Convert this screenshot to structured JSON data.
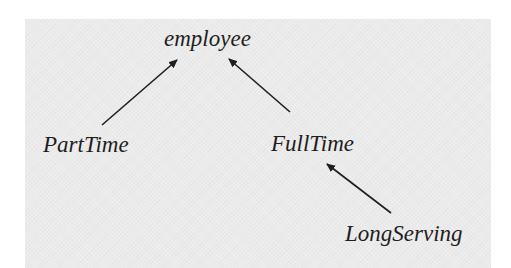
{
  "diagram": {
    "type": "inheritance-hierarchy",
    "background_color": "#ebebeb",
    "line_color": "#1e1e1e",
    "nodes": [
      {
        "id": "employee",
        "label": "employee"
      },
      {
        "id": "parttime",
        "label": "PartTime"
      },
      {
        "id": "fulltime",
        "label": "FullTime"
      },
      {
        "id": "longserving",
        "label": "LongServing"
      }
    ],
    "edges": [
      {
        "from": "PartTime",
        "to": "employee"
      },
      {
        "from": "FullTime",
        "to": "employee"
      },
      {
        "from": "LongServing",
        "to": "FullTime"
      }
    ]
  }
}
